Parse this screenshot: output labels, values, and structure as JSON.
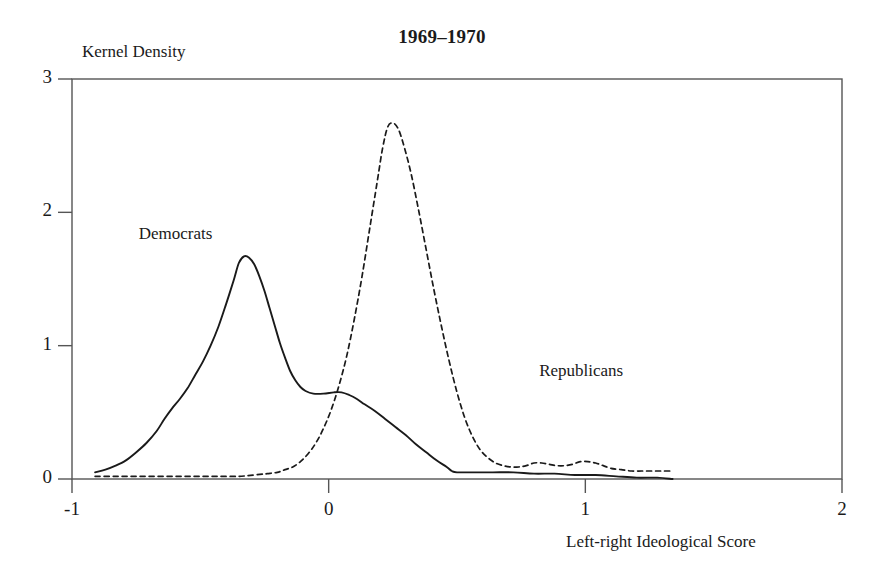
{
  "chart_data": {
    "type": "line",
    "title": "1969–1970",
    "xlabel": "Left-right Ideological Score",
    "ylabel": "Kernel Density",
    "xlim": [
      -1,
      2
    ],
    "ylim": [
      0,
      3
    ],
    "xticks": [
      -1,
      0,
      1,
      2
    ],
    "xtick_labels": [
      "-1",
      "0",
      "1",
      "2"
    ],
    "yticks": [
      0,
      1,
      2,
      3
    ],
    "ytick_labels": [
      "0",
      "1",
      "2",
      "3"
    ],
    "grid": false,
    "legend": "inline-annotations",
    "frame": "box",
    "series": [
      {
        "name": "Democrats",
        "style": "solid",
        "color": "#1a1a1a",
        "label_x": -0.74,
        "label_y": 1.83,
        "points": [
          [
            -0.91,
            0.05
          ],
          [
            -0.87,
            0.07
          ],
          [
            -0.83,
            0.1
          ],
          [
            -0.79,
            0.14
          ],
          [
            -0.75,
            0.2
          ],
          [
            -0.71,
            0.27
          ],
          [
            -0.67,
            0.36
          ],
          [
            -0.64,
            0.45
          ],
          [
            -0.61,
            0.53
          ],
          [
            -0.58,
            0.6
          ],
          [
            -0.55,
            0.68
          ],
          [
            -0.52,
            0.78
          ],
          [
            -0.49,
            0.88
          ],
          [
            -0.46,
            1.0
          ],
          [
            -0.43,
            1.14
          ],
          [
            -0.4,
            1.31
          ],
          [
            -0.37,
            1.49
          ],
          [
            -0.35,
            1.62
          ],
          [
            -0.33,
            1.67
          ],
          [
            -0.31,
            1.66
          ],
          [
            -0.29,
            1.61
          ],
          [
            -0.27,
            1.52
          ],
          [
            -0.25,
            1.41
          ],
          [
            -0.23,
            1.28
          ],
          [
            -0.21,
            1.15
          ],
          [
            -0.19,
            1.02
          ],
          [
            -0.17,
            0.91
          ],
          [
            -0.15,
            0.81
          ],
          [
            -0.13,
            0.74
          ],
          [
            -0.11,
            0.69
          ],
          [
            -0.09,
            0.66
          ],
          [
            -0.06,
            0.64
          ],
          [
            -0.02,
            0.64
          ],
          [
            0.02,
            0.65
          ],
          [
            0.05,
            0.65
          ],
          [
            0.08,
            0.63
          ],
          [
            0.11,
            0.6
          ],
          [
            0.14,
            0.56
          ],
          [
            0.18,
            0.51
          ],
          [
            0.22,
            0.45
          ],
          [
            0.26,
            0.39
          ],
          [
            0.3,
            0.33
          ],
          [
            0.34,
            0.26
          ],
          [
            0.38,
            0.2
          ],
          [
            0.42,
            0.14
          ],
          [
            0.46,
            0.09
          ],
          [
            0.48,
            0.06
          ],
          [
            0.5,
            0.05
          ],
          [
            0.56,
            0.05
          ],
          [
            0.64,
            0.05
          ],
          [
            0.72,
            0.05
          ],
          [
            0.8,
            0.04
          ],
          [
            0.88,
            0.04
          ],
          [
            0.96,
            0.03
          ],
          [
            1.04,
            0.03
          ],
          [
            1.12,
            0.02
          ],
          [
            1.2,
            0.01
          ],
          [
            1.28,
            0.01
          ],
          [
            1.34,
            0.0
          ]
        ]
      },
      {
        "name": "Republicans",
        "style": "dashed",
        "color": "#1a1a1a",
        "label_x": 0.82,
        "label_y": 0.8,
        "points": [
          [
            -0.91,
            0.02
          ],
          [
            -0.83,
            0.02
          ],
          [
            -0.75,
            0.02
          ],
          [
            -0.67,
            0.02
          ],
          [
            -0.59,
            0.02
          ],
          [
            -0.51,
            0.02
          ],
          [
            -0.43,
            0.02
          ],
          [
            -0.35,
            0.02
          ],
          [
            -0.29,
            0.03
          ],
          [
            -0.24,
            0.04
          ],
          [
            -0.2,
            0.05
          ],
          [
            -0.17,
            0.07
          ],
          [
            -0.14,
            0.09
          ],
          [
            -0.11,
            0.13
          ],
          [
            -0.08,
            0.19
          ],
          [
            -0.05,
            0.27
          ],
          [
            -0.02,
            0.38
          ],
          [
            0.01,
            0.52
          ],
          [
            0.04,
            0.7
          ],
          [
            0.07,
            0.92
          ],
          [
            0.1,
            1.2
          ],
          [
            0.13,
            1.52
          ],
          [
            0.16,
            1.88
          ],
          [
            0.19,
            2.24
          ],
          [
            0.21,
            2.48
          ],
          [
            0.23,
            2.64
          ],
          [
            0.25,
            2.67
          ],
          [
            0.27,
            2.63
          ],
          [
            0.29,
            2.52
          ],
          [
            0.32,
            2.3
          ],
          [
            0.35,
            2.02
          ],
          [
            0.38,
            1.72
          ],
          [
            0.41,
            1.42
          ],
          [
            0.44,
            1.14
          ],
          [
            0.47,
            0.88
          ],
          [
            0.5,
            0.65
          ],
          [
            0.53,
            0.46
          ],
          [
            0.56,
            0.32
          ],
          [
            0.59,
            0.22
          ],
          [
            0.62,
            0.16
          ],
          [
            0.65,
            0.12
          ],
          [
            0.68,
            0.1
          ],
          [
            0.71,
            0.09
          ],
          [
            0.74,
            0.09
          ],
          [
            0.77,
            0.1
          ],
          [
            0.8,
            0.12
          ],
          [
            0.83,
            0.12
          ],
          [
            0.86,
            0.11
          ],
          [
            0.89,
            0.1
          ],
          [
            0.92,
            0.1
          ],
          [
            0.95,
            0.11
          ],
          [
            0.98,
            0.13
          ],
          [
            1.01,
            0.13
          ],
          [
            1.04,
            0.12
          ],
          [
            1.07,
            0.1
          ],
          [
            1.1,
            0.08
          ],
          [
            1.14,
            0.07
          ],
          [
            1.18,
            0.06
          ],
          [
            1.22,
            0.06
          ],
          [
            1.26,
            0.06
          ],
          [
            1.3,
            0.06
          ],
          [
            1.34,
            0.06
          ]
        ]
      }
    ]
  }
}
